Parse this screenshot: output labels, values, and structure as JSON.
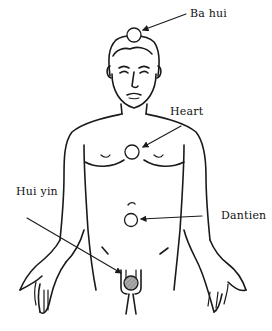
{
  "diagram": {
    "colors": {
      "line": "#1a1a1a",
      "background": "#ffffff",
      "point_fill": "#ffffff",
      "huiyin_fill": "#9a9a9a"
    },
    "points": [
      {
        "id": "ba-hui",
        "label": "Ba hui",
        "x": 134,
        "y": 35
      },
      {
        "id": "heart",
        "label": "Heart",
        "x": 132,
        "y": 152
      },
      {
        "id": "dantien",
        "label": "Dantien",
        "x": 131,
        "y": 220
      },
      {
        "id": "hui-yin",
        "label": "Hui yin",
        "x": 130,
        "y": 283
      }
    ]
  }
}
